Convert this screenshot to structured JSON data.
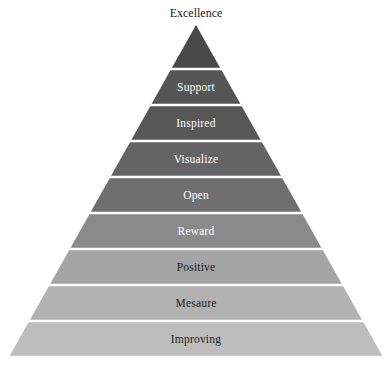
{
  "diagram": {
    "type": "pyramid",
    "apex_label": "Excellence",
    "apex_color": "#484848",
    "levels": [
      {
        "label": "Support",
        "color": "#555555",
        "text_color": "#ffffff"
      },
      {
        "label": "Inspired",
        "color": "#575757",
        "text_color": "#ffffff"
      },
      {
        "label": "Visualize",
        "color": "#646464",
        "text_color": "#ffffff"
      },
      {
        "label": "Open",
        "color": "#6f6f6f",
        "text_color": "#ffffff"
      },
      {
        "label": "Reward",
        "color": "#8a8a8a",
        "text_color": "#ffffff"
      },
      {
        "label": "Positive",
        "color": "#a4a4a4",
        "text_color": "#222222"
      },
      {
        "label": "Mesaure",
        "color": "#b2b2b2",
        "text_color": "#222222"
      },
      {
        "label": "Improving",
        "color": "#bdbdbd",
        "text_color": "#222222"
      }
    ],
    "order": "top-to-bottom"
  }
}
